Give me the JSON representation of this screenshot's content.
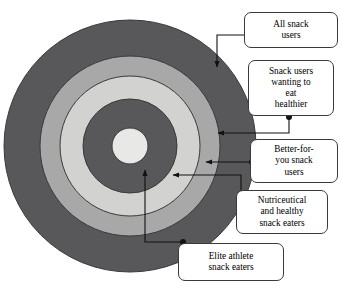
{
  "diagram": {
    "type": "concentric-circles",
    "center": {
      "x": 130,
      "y": 146
    },
    "colors": {
      "outer_ring": "#58585a",
      "ring_2": "#a8a8a8",
      "ring_3": "#d2d2d0",
      "ring_4": "#58585a",
      "core": "#e8e8e6",
      "outline": "#3a3a3a",
      "background": "#ffffff",
      "connector": "#111111"
    },
    "rings": [
      {
        "name": "all-snack-users",
        "radius": 126,
        "fill": "#58585a"
      },
      {
        "name": "snack-users-wanting-to-eat-healthier",
        "radius": 90,
        "fill": "#a8a8a8"
      },
      {
        "name": "better-for-you-snack-users",
        "radius": 70,
        "fill": "#d2d2d0"
      },
      {
        "name": "nutriceutical-and-healthy-snack-eaters",
        "radius": 47,
        "fill": "#58585a"
      },
      {
        "name": "elite-athlete-snack-eaters",
        "radius": 18,
        "fill": "#e8e8e6"
      }
    ]
  },
  "labels": [
    {
      "id": "all-snack-users",
      "text": "All snack\nusers",
      "x": 244,
      "y": 12,
      "w": 94,
      "h": 36
    },
    {
      "id": "snack-users-wanting-to-eat-healthier",
      "text": "Snack users\nwanting to\neat\nhealthier",
      "x": 248,
      "y": 60,
      "w": 86,
      "h": 56
    },
    {
      "id": "better-for-you-snack-users",
      "text": "Better-for-\nyou snack\nusers",
      "x": 250,
      "y": 139,
      "w": 88,
      "h": 44
    },
    {
      "id": "nutriceutical-and-healthy-snack-eaters",
      "text": "Nutriceutical\nand healthy\nsnack eaters",
      "x": 236,
      "y": 190,
      "w": 92,
      "h": 44
    },
    {
      "id": "elite-athlete-snack-eaters",
      "text": "Elite athlete\nsnack eaters",
      "x": 178,
      "y": 243,
      "w": 106,
      "h": 38
    }
  ],
  "connectors": [
    {
      "id": "connector-all-snack-users",
      "dot": {
        "x": 247,
        "y": 35
      },
      "target_ring": "all-snack-users"
    },
    {
      "id": "connector-snack-users-wanting-to-eat-healthier",
      "dot": {
        "x": 289,
        "y": 117
      },
      "target_ring": "snack-users-wanting-to-eat-healthier"
    },
    {
      "id": "connector-better-for-you-snack-users",
      "dot": {
        "x": 252,
        "y": 162
      },
      "target_ring": "better-for-you-snack-users"
    },
    {
      "id": "connector-nutriceutical-and-healthy-snack-eaters",
      "dot": {
        "x": 241,
        "y": 211
      },
      "target_ring": "nutriceutical-and-healthy-snack-eaters"
    },
    {
      "id": "connector-elite-athlete-snack-eaters",
      "dot": {
        "x": 183,
        "y": 242
      },
      "target_ring": "elite-athlete-snack-eaters"
    }
  ]
}
